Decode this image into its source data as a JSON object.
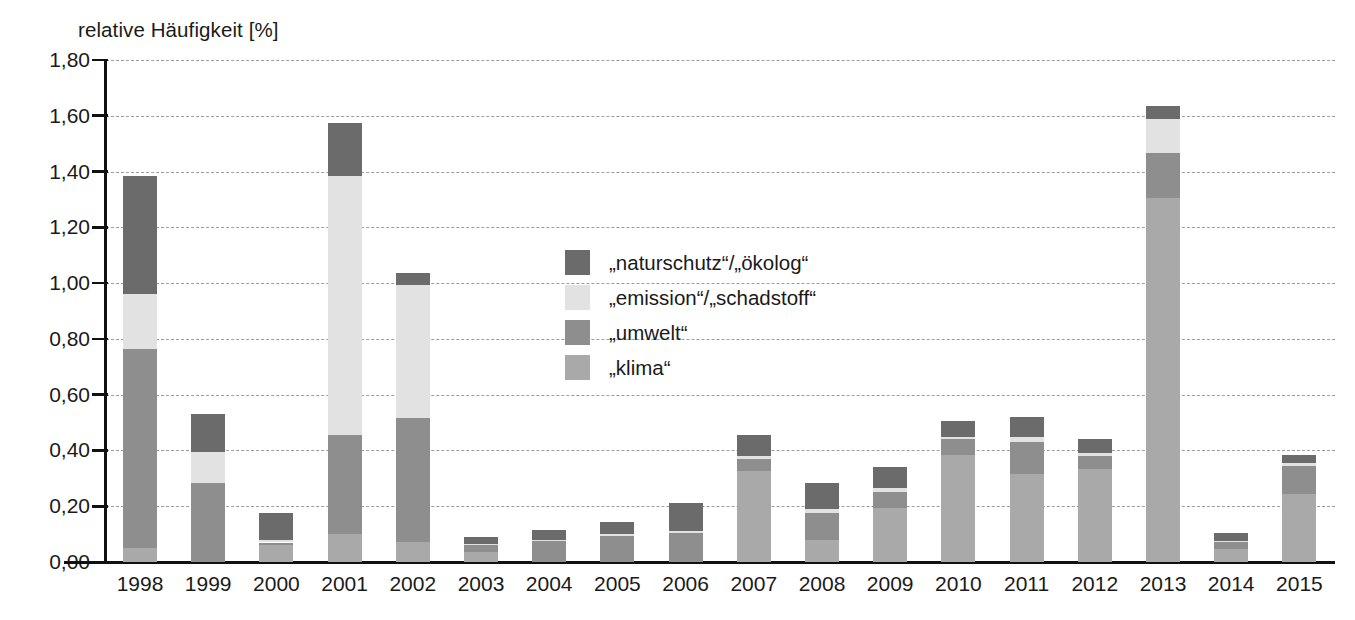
{
  "chart_data": {
    "type": "bar",
    "subtype": "stacked-bar",
    "title": "",
    "xlabel": "",
    "ylabel": "relative Häufigkeit [%]",
    "ylim": [
      0.0,
      1.8
    ],
    "ytick_step": 0.2,
    "grid": true,
    "legend_position": "center",
    "decimal_separator": ",",
    "categories": [
      "1998",
      "1999",
      "2000",
      "2001",
      "2002",
      "2003",
      "2004",
      "2005",
      "2006",
      "2007",
      "2008",
      "2009",
      "2010",
      "2011",
      "2012",
      "2013",
      "2014",
      "2015"
    ],
    "ytick_labels": [
      "1,80",
      "1,60",
      "1,40",
      "1,20",
      "1,00",
      "0,80",
      "0,60",
      "0,40",
      "0,20",
      "0,00"
    ],
    "ytick_values": [
      1.8,
      1.6,
      1.4,
      1.2,
      1.0,
      0.8,
      0.6,
      0.4,
      0.2,
      0.0
    ],
    "series": [
      {
        "name": "„klima“",
        "key": "klima",
        "color": "#a9a9a9",
        "values": [
          0.05,
          0.0,
          0.06,
          0.1,
          0.07,
          0.035,
          0.0,
          0.0,
          0.0,
          0.325,
          0.08,
          0.195,
          0.385,
          0.315,
          0.335,
          1.305,
          0.045,
          0.245
        ]
      },
      {
        "name": "„umwelt“",
        "key": "umwelt",
        "color": "#8e8e8e",
        "values": [
          0.715,
          0.285,
          0.01,
          0.355,
          0.445,
          0.025,
          0.075,
          0.095,
          0.105,
          0.045,
          0.095,
          0.055,
          0.055,
          0.115,
          0.045,
          0.16,
          0.025,
          0.1
        ]
      },
      {
        "name": "„emission“/„schadstoff“",
        "key": "emission",
        "color": "#e2e2e2",
        "values": [
          0.195,
          0.11,
          0.01,
          0.93,
          0.48,
          0.005,
          0.005,
          0.005,
          0.005,
          0.01,
          0.015,
          0.015,
          0.01,
          0.02,
          0.01,
          0.125,
          0.005,
          0.01
        ]
      },
      {
        "name": "„naturschutz“/„ökolog“",
        "key": "naturschutz",
        "color": "#6b6b6b",
        "values": [
          0.425,
          0.135,
          0.095,
          0.19,
          0.04,
          0.025,
          0.035,
          0.045,
          0.1,
          0.075,
          0.095,
          0.075,
          0.055,
          0.07,
          0.05,
          0.045,
          0.03,
          0.03
        ]
      }
    ],
    "totals": [
      1.385,
      0.53,
      0.175,
      1.575,
      1.035,
      0.09,
      0.115,
      0.145,
      0.21,
      0.455,
      0.285,
      0.34,
      0.505,
      0.52,
      0.44,
      1.635,
      0.105,
      0.385
    ]
  },
  "legend": {
    "items": [
      {
        "label": "„naturschutz“/„ökolog“",
        "color": "#6b6b6b"
      },
      {
        "label": "„emission“/„schadstoff“",
        "color": "#e2e2e2"
      },
      {
        "label": "„umwelt“",
        "color": "#8e8e8e"
      },
      {
        "label": "„klima“",
        "color": "#a9a9a9"
      }
    ]
  },
  "axis": {
    "y_title": "relative Häufigkeit [%]"
  },
  "colors": {
    "grid": "#9d9d9d",
    "axis": "#111111",
    "background": "#ffffff",
    "text": "#1a1a1a"
  }
}
